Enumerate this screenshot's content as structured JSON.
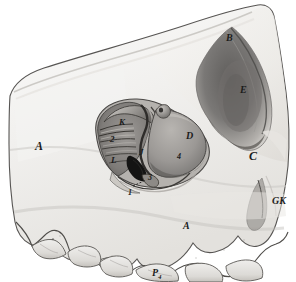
{
  "figure": {
    "kind": "anatomical-line-drawing",
    "medium": "pencil-and-wash-shading",
    "background_color": "#ffffff",
    "bone_light_color": "#f2f1ef",
    "bone_mid_color": "#d9d7d3",
    "shadow_dark_color": "#6e6c6a",
    "deep_shadow_color": "#2a2a2a",
    "outline_color": "#3a3a3a"
  },
  "labels": [
    {
      "id": "label-a-left",
      "text": "A",
      "x": 35,
      "y": 140,
      "size": "lg"
    },
    {
      "id": "label-b",
      "text": "B",
      "x": 226,
      "y": 33,
      "size": "md"
    },
    {
      "id": "label-e",
      "text": "E",
      "x": 240,
      "y": 85,
      "size": "md"
    },
    {
      "id": "label-c",
      "text": "C",
      "x": 249,
      "y": 150,
      "size": "lg"
    },
    {
      "id": "label-d",
      "text": "D",
      "x": 186,
      "y": 131,
      "size": "md"
    },
    {
      "id": "label-k",
      "text": "K",
      "x": 119,
      "y": 118,
      "size": "sm"
    },
    {
      "id": "label-2",
      "text": "2",
      "x": 110,
      "y": 135,
      "size": "sm"
    },
    {
      "id": "label-l",
      "text": "L",
      "x": 111,
      "y": 156,
      "size": "sm"
    },
    {
      "id": "label-j",
      "text": "J",
      "x": 139,
      "y": 148,
      "size": "sm"
    },
    {
      "id": "label-4-inner",
      "text": "4",
      "x": 177,
      "y": 153,
      "size": "xs"
    },
    {
      "id": "label-3",
      "text": "3",
      "x": 148,
      "y": 174,
      "size": "xs"
    },
    {
      "id": "label-1",
      "text": "1",
      "x": 128,
      "y": 189,
      "size": "xs"
    },
    {
      "id": "label-a-bottom",
      "text": "A",
      "x": 183,
      "y": 221,
      "size": "md"
    },
    {
      "id": "label-gk",
      "text": "GK",
      "x": 272,
      "y": 196,
      "size": "md"
    }
  ],
  "subscript_labels": [
    {
      "id": "label-p4",
      "base": "P",
      "sub": "4",
      "x": 152,
      "y": 268,
      "size": "md"
    }
  ],
  "leader_lines": [
    {
      "id": "leader-1",
      "x1": 133,
      "y1": 186,
      "x2": 146,
      "y2": 180
    }
  ]
}
